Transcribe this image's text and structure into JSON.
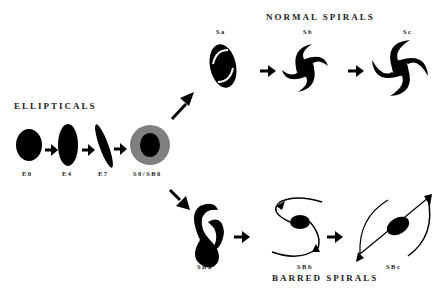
{
  "diagram": {
    "type": "Hubble tuning fork galaxy classification",
    "groups": {
      "ellipticals": "ELLIPTICALS",
      "normal_spirals": "NORMAL SPIRALS",
      "barred_spirals": "BARRED SPIRALS"
    },
    "ellipticals": [
      {
        "id": "E0",
        "label": "E0"
      },
      {
        "id": "E4",
        "label": "E4"
      },
      {
        "id": "E7",
        "label": "E7"
      }
    ],
    "lenticular": {
      "id": "S0/SB0",
      "label": "S0/SB0",
      "inner_color": "#000000",
      "outer_color": "#808080"
    },
    "normal_spirals": [
      {
        "id": "Sa",
        "label": "Sa"
      },
      {
        "id": "Sb",
        "label": "Sb"
      },
      {
        "id": "Sc",
        "label": "Sc"
      }
    ],
    "barred_spirals": [
      {
        "id": "SBa",
        "label": "SBa"
      },
      {
        "id": "SBb",
        "label": "SBb"
      },
      {
        "id": "SBc",
        "label": "SBc"
      }
    ],
    "colors": {
      "shape": "#000000",
      "ring": "#808080",
      "background": "#ffffff"
    }
  }
}
